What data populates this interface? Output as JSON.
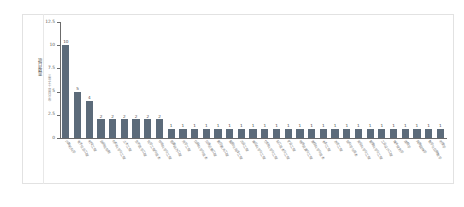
{
  "side_panel": {
    "vertical_label": "三等奖十项目分布"
  },
  "axis": {
    "y_title": "项目数量",
    "y_ticks": [
      "0",
      "2.5",
      "5",
      "7.5",
      "10",
      "12.5"
    ]
  },
  "chart_data": {
    "type": "bar",
    "title": "",
    "xlabel": "",
    "ylabel": "项目数量",
    "ylim": [
      0,
      12.5
    ],
    "grid": false,
    "legend": null,
    "bar_color": "#5c6b7a",
    "categories": [
      "计算机科学",
      "电子信息工程",
      "机械工程",
      "自动化控制",
      "材料科学与工程",
      "土木工程",
      "生物医学工程",
      "化学工程与技术",
      "环境科学与工程",
      "能源动力工程",
      "光学工程",
      "仪器科学与技术",
      "交通运输工程",
      "航空航天工程",
      "船舶与海洋工程",
      "农业工程",
      "食品科学与工程",
      "纺织科学与工程",
      "轻工技术与工程",
      "矿业工程",
      "地质资源与工程",
      "测绘科学与技术",
      "水利工程",
      "冶金工程",
      "核科学与技术",
      "安全科学与工程",
      "管理科学与工程",
      "工业设计工程",
      "城乡规划学",
      "建筑学",
      "风景园林学",
      "数学与应用数学",
      "物理学"
    ],
    "values": [
      10,
      5,
      4,
      2,
      2,
      2,
      2,
      2,
      2,
      1,
      1,
      1,
      1,
      1,
      1,
      1,
      1,
      1,
      1,
      1,
      1,
      1,
      1,
      1,
      1,
      1,
      1,
      1,
      1,
      1,
      1,
      1,
      1
    ]
  }
}
